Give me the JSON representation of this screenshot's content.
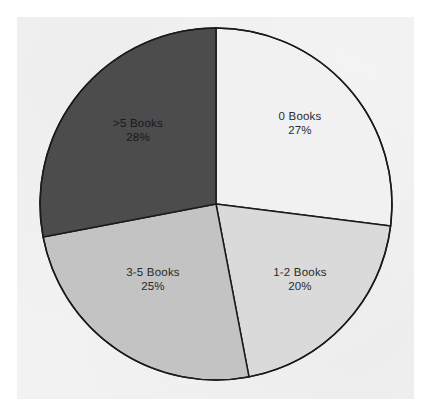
{
  "chart_data": {
    "type": "pie",
    "title": "",
    "subtitle": "",
    "xlabel": "",
    "ylabel": "",
    "legend": "none",
    "labels_position": "inside-slices",
    "start_angle_deg": 0,
    "direction": "clockwise",
    "categories": [
      "0 Books",
      "1-2 Books",
      "3-5 Books",
      ">5 Books"
    ],
    "values": [
      27,
      20,
      25,
      28
    ],
    "value_unit": "%",
    "slices": [
      {
        "label": "0 Books",
        "value": 27,
        "value_text": "27%",
        "color": "#f1f1f1",
        "start_deg": 0,
        "end_deg": 97.2,
        "label_x": 300,
        "label_y": 124
      },
      {
        "label": "1-2 Books",
        "value": 20,
        "value_text": "20%",
        "color": "#dadada",
        "start_deg": 97.2,
        "end_deg": 169.2,
        "label_x": 300,
        "label_y": 280
      },
      {
        "label": "3-5 Books",
        "value": 25,
        "value_text": "25%",
        "color": "#c3c3c3",
        "start_deg": 169.2,
        "end_deg": 259.2,
        "label_x": 153,
        "label_y": 280
      },
      {
        "label": ">5 Books",
        "value": 28,
        "value_text": "28%",
        "color": "#4c4c4c",
        "start_deg": 259.2,
        "end_deg": 360,
        "label_x": 138,
        "label_y": 131
      }
    ],
    "outline_color": "#1a1a1a",
    "background_color": "#f2f2f2",
    "page_color": "#ffffff",
    "center_x": 216,
    "center_y": 204,
    "radius": 176
  }
}
